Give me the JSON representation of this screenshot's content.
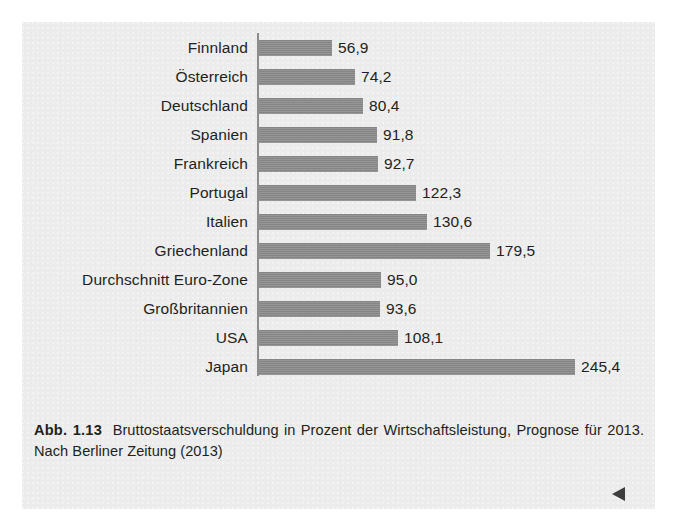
{
  "figure": {
    "caption_number": "Abb. 1.13",
    "caption_text": "Bruttostaatsverschuldung in Prozent der Wirtschaftsleistung, Prognose für 2013. Nach Berliner Zeitung (2013)",
    "end_marker_icon": "left-triangle-icon",
    "bar_color": "#8a8a8a",
    "panel_color": "#ececec",
    "text_color": "#231f20"
  },
  "chart_data": {
    "type": "bar",
    "orientation": "horizontal",
    "title": "Bruttostaatsverschuldung in Prozent der Wirtschaftsleistung, Prognose für 2013",
    "source": "Berliner Zeitung (2013)",
    "xlabel": "",
    "ylabel": "",
    "xlim": [
      0,
      245.4
    ],
    "grid": false,
    "legend": false,
    "decimal_separator": ",",
    "categories": [
      "Finnland",
      "Österreich",
      "Deutschland",
      "Spanien",
      "Frankreich",
      "Portugal",
      "Italien",
      "Griechenland",
      "Durchschnitt Euro-Zone",
      "Großbritannien",
      "USA",
      "Japan"
    ],
    "values": [
      56.9,
      74.2,
      80.4,
      91.8,
      92.7,
      122.3,
      130.6,
      179.5,
      95.0,
      93.6,
      108.1,
      245.4
    ],
    "value_labels": [
      "56,9",
      "74,2",
      "80,4",
      "91,8",
      "92,7",
      "122,3",
      "130,6",
      "179,5",
      "95,0",
      "93,6",
      "108,1",
      "245,4"
    ]
  }
}
